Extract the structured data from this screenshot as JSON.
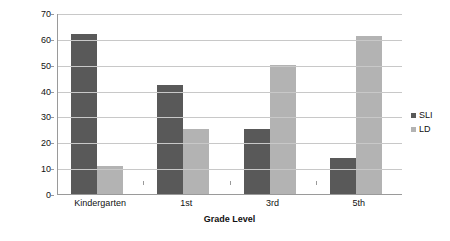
{
  "chart_data": {
    "type": "bar",
    "title": "",
    "xlabel": "Grade Level",
    "ylabel": "Percentage of Special Education",
    "categories": [
      "Kindergarten",
      "1st",
      "3rd",
      "5th"
    ],
    "series": [
      {
        "name": "SLI",
        "color": "#595959",
        "values": [
          62,
          42,
          25,
          14
        ]
      },
      {
        "name": "LD",
        "color": "#b3b3b3",
        "values": [
          11,
          25,
          50,
          61
        ]
      }
    ],
    "ylim": [
      0,
      70
    ],
    "yticks": [
      0,
      10,
      20,
      30,
      40,
      50,
      60,
      70
    ],
    "ytick_labels": [
      "0",
      "10",
      "20",
      "30",
      "40",
      "50",
      "60",
      "70"
    ],
    "grid": true,
    "legend_position": "right"
  }
}
